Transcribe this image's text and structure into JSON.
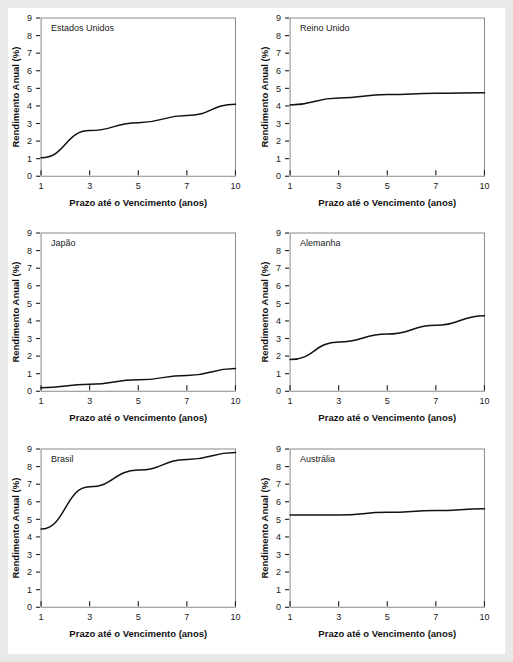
{
  "figure": {
    "background": "#ffffff",
    "outer_background": "#e9e9e7",
    "line_color": "#111111",
    "frame_color": "#8a8a8a"
  },
  "axis": {
    "xlabel": "Prazo até o Vencimento (anos)",
    "ylabel": "Rendimento Anual (%)",
    "xticks": [
      "1",
      "3",
      "5",
      "7",
      "10"
    ],
    "yticks": [
      "0",
      "1",
      "2",
      "3",
      "4",
      "5",
      "6",
      "7",
      "8",
      "9"
    ]
  },
  "chart_data": {
    "type": "line",
    "title": "",
    "xlabel": "Prazo até o Vencimento (anos)",
    "ylabel": "Rendimento Anual (%)",
    "x": [
      1,
      3,
      5,
      7,
      10
    ],
    "categories": [
      "1",
      "3",
      "5",
      "7",
      "10"
    ],
    "xlim": [
      1,
      10
    ],
    "ylim": [
      0,
      9
    ],
    "x_scale": "categorical-even-spacing",
    "grid": false,
    "legend": "none",
    "panel_layout": {
      "rows": 3,
      "cols": 2
    },
    "series": [
      {
        "name": "Estados Unidos",
        "values": [
          1.05,
          2.6,
          3.05,
          3.45,
          4.1
        ]
      },
      {
        "name": "Reino Unido",
        "values": [
          4.05,
          4.45,
          4.65,
          4.72,
          4.75
        ]
      },
      {
        "name": "Japão",
        "values": [
          0.2,
          0.4,
          0.65,
          0.9,
          1.3
        ]
      },
      {
        "name": "Alemanha",
        "values": [
          1.8,
          2.8,
          3.25,
          3.75,
          4.3
        ]
      },
      {
        "name": "Brasil",
        "values": [
          4.45,
          6.85,
          7.8,
          8.4,
          8.8
        ]
      },
      {
        "name": "Austrália",
        "values": [
          5.25,
          5.25,
          5.4,
          5.5,
          5.6
        ]
      }
    ]
  },
  "panels": [
    {
      "title": "Estados Unidos"
    },
    {
      "title": "Reino Unido"
    },
    {
      "title": "Japão"
    },
    {
      "title": "Alemanha"
    },
    {
      "title": "Brasil"
    },
    {
      "title": "Austrália"
    }
  ]
}
